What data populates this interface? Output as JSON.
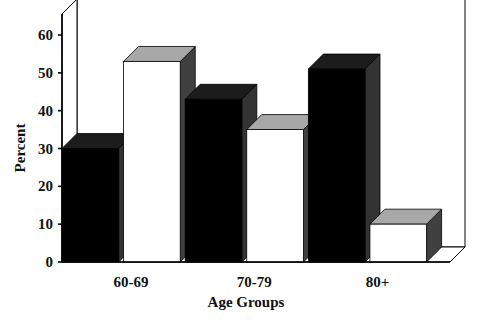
{
  "chart_data": {
    "type": "bar",
    "title": "",
    "xlabel": "Age Groups",
    "ylabel": "Percent",
    "categories": [
      "60-69",
      "70-79",
      "80+"
    ],
    "series": [
      {
        "name": "series-1",
        "color": "#000000",
        "values": [
          30,
          43,
          51
        ]
      },
      {
        "name": "series-2",
        "color": "#ffffff",
        "values": [
          53,
          35,
          10
        ]
      }
    ],
    "bars": [
      {
        "group": "60-69",
        "series": "series-1",
        "value": 30,
        "fill": "#000000"
      },
      {
        "group": "60-69",
        "series": "series-2",
        "value": 53,
        "fill": "#ffffff"
      },
      {
        "group": "70-79",
        "series": "series-1",
        "value": 43,
        "fill": "#000000"
      },
      {
        "group": "70-79",
        "series": "series-2",
        "value": 35,
        "fill": "#ffffff"
      },
      {
        "group": "80+",
        "series": "series-1",
        "value": 51,
        "fill": "#000000"
      },
      {
        "group": "80+",
        "series": "series-2",
        "value": 10,
        "fill": "#ffffff"
      }
    ],
    "ylim": [
      0,
      60
    ],
    "yticks": [
      "0",
      "10",
      "20",
      "30",
      "40",
      "50",
      "60"
    ],
    "ytick_values": [
      0,
      10,
      20,
      30,
      40,
      50,
      60
    ],
    "grid": true,
    "legend": "none",
    "projection": "3d",
    "colors": {
      "bar_dark_front": "#000000",
      "bar_dark_top": "#1c1c1c",
      "bar_dark_side": "#333333",
      "bar_light_front": "#ffffff",
      "bar_light_top": "#a8a8a8",
      "bar_light_side": "#404040",
      "axis": "#000000",
      "grid": "#d8d8d8",
      "text": "#111111",
      "background": "#ffffff"
    }
  }
}
